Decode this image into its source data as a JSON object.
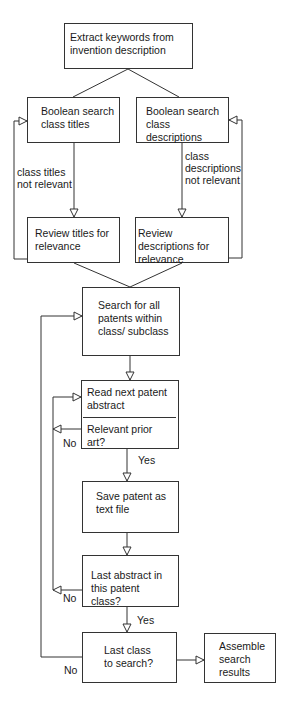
{
  "flowchart": {
    "nodes": {
      "extract": {
        "text": "Extract keywords from invention description"
      },
      "bool_titles": {
        "text": "Boolean search class titles"
      },
      "bool_desc": {
        "text": "Boolean search class descriptions"
      },
      "review_titles": {
        "text": "Review titles for relevance"
      },
      "review_desc": {
        "text": "Review descriptions for relevance"
      },
      "search_all": {
        "text": "Search for all patents within class/ subclass"
      },
      "read_next": {
        "text": "Read next patent abstract",
        "question": "Relevant prior art?"
      },
      "save": {
        "text": "Save patent as text file"
      },
      "last_abstract": {
        "text": "Last abstract in this patent class?"
      },
      "last_class": {
        "text": "Last class to search?"
      },
      "assemble": {
        "text": "Assemble search results"
      }
    },
    "edge_labels": {
      "titles_not_relevant": "class titles not relevant",
      "desc_not_relevant": "class descriptions not relevant",
      "relevant_no": "No",
      "relevant_yes": "Yes",
      "last_abstract_no": "No",
      "last_abstract_yes": "Yes",
      "last_class_no": "No"
    },
    "colors": {
      "line": "#333333",
      "background": "#ffffff"
    }
  }
}
